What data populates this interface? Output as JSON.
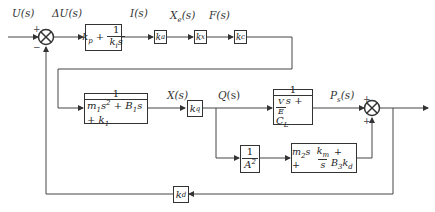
{
  "diagram": {
    "type": "control-block-diagram",
    "signals": {
      "input": "U(s)",
      "error": "ΔU(s)",
      "current": "I(s)",
      "valve_disp": "X_e(s)",
      "force": "F(s)",
      "position": "X(s)",
      "flow": "Q(s)",
      "pressure": "P_s(s)"
    },
    "blocks": {
      "pi_controller": {
        "lead": "k_p +",
        "num": "1",
        "den": "k_i s"
      },
      "gain_ka": "k_a",
      "gain_kx": "k_x",
      "gain_kc": "k_c",
      "mass_spring": {
        "num": "1",
        "den": "m_1 s^2 + B_1 s + k_1"
      },
      "gain_kq": "k_q",
      "pressure_dyn": {
        "num": "1",
        "den": "V/E s + C_L"
      },
      "area_inv": {
        "num": "1",
        "den": "A^2"
      },
      "load_dyn": "m_2 s + k_m/s + B_3 k_d",
      "gain_kd": "k_d"
    },
    "summing_junctions": {
      "sum1": {
        "signs": [
          "+",
          "−"
        ]
      },
      "sum2": {
        "signs": [
          "+",
          "+"
        ]
      }
    }
  }
}
